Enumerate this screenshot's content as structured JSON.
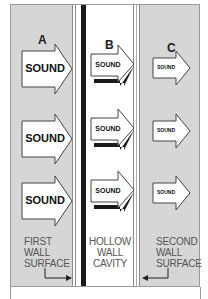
{
  "columns": [
    {
      "letter": "A",
      "arrow_label": "SOUND",
      "caption": [
        "FIRST",
        "WALL",
        "SURFACE"
      ]
    },
    {
      "letter": "B",
      "arrow_label": "SOUND",
      "caption": [
        "HOLLOW",
        "WALL",
        "CAVITY"
      ]
    },
    {
      "letter": "C",
      "arrow_label": "SOUND",
      "caption": [
        "SECOND",
        "WALL",
        "SURFACE"
      ]
    }
  ],
  "colors": {
    "wall_gray": "#d6d6d6",
    "cavity_white": "#ffffff",
    "barrier_black": "#1a1a1a",
    "arrow_fill": "#ffffff",
    "arrow_stroke": "#444444",
    "caption_text": "#555555"
  }
}
